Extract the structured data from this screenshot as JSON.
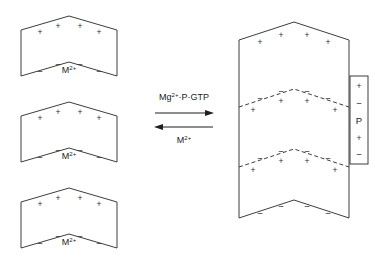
{
  "figure": {
    "type": "schematic-diagram",
    "background_color": "#ffffff",
    "stroke_color": "#3d3d3d",
    "text_color": "#1a1a1a",
    "width": 375,
    "height": 267
  },
  "reaction": {
    "forward_label_main": "Mg",
    "forward_label_sup": "2+",
    "forward_label_tail": "·P·GTP",
    "forward_label_full": "Mg2+·P·GTP",
    "reverse_label_main": "M",
    "reverse_label_sup": "2+",
    "reverse_label_full": "M2+",
    "forward_direction": "right",
    "reverse_direction": "left"
  },
  "left_subunits": [
    {
      "id": "subunit-1",
      "ion_label_main": "M",
      "ion_label_sup": "2+",
      "top_charges": [
        "+",
        "+",
        "+",
        "+"
      ],
      "bottom_charges": [
        "−",
        "−",
        "−",
        "−"
      ]
    },
    {
      "id": "subunit-2",
      "ion_label_main": "M",
      "ion_label_sup": "2+",
      "top_charges": [
        "+",
        "+",
        "+",
        "+"
      ],
      "bottom_charges": [
        "−",
        "−",
        "−",
        "−"
      ]
    },
    {
      "id": "subunit-3",
      "ion_label_main": "M",
      "ion_label_sup": "2+",
      "top_charges": [
        "+",
        "+",
        "+",
        "+"
      ],
      "bottom_charges": [
        "−",
        "−",
        "−",
        "−"
      ]
    }
  ],
  "polymer": {
    "id": "assembled-polymer",
    "segments": 3,
    "top_charges": [
      "+",
      "+",
      "+",
      "+"
    ],
    "bottom_charges": [
      "−",
      "−",
      "−",
      "−"
    ],
    "interface_upper_charges": {
      "above": [
        "−",
        "−",
        "−",
        "−"
      ],
      "below": [
        "+",
        "+",
        "+",
        "+"
      ]
    },
    "interface_lower_charges": {
      "above": [
        "−",
        "−",
        "−",
        "−"
      ],
      "below": [
        "+",
        "+",
        "+",
        "+"
      ]
    }
  },
  "p_box": {
    "label": "P",
    "charges_top": [
      "+",
      "−"
    ],
    "charges_bottom": [
      "+",
      "−"
    ]
  }
}
